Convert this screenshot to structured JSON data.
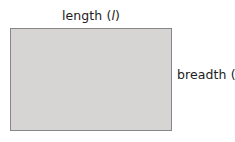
{
  "figure": {
    "type": "geometry-diagram",
    "shape": "rectangle",
    "background_color": "#ffffff",
    "rectangle": {
      "name": "rectangle",
      "fill_color": "#d6d5d3",
      "stroke_color": "#878787",
      "stroke_width_px": 1.5,
      "x_px": 10,
      "y_px": 28,
      "width_px": 162,
      "height_px": 103
    },
    "labels": {
      "length": {
        "text": "length (l)",
        "word": "length",
        "open_paren": "(",
        "variable": "l",
        "close_paren": ")",
        "position": "top-center",
        "color": "#1c1c1c"
      },
      "breadth": {
        "text": "breadth (b)",
        "word": "breadth",
        "open_paren": "(",
        "variable": "b",
        "close_paren": ")",
        "position": "right-middle",
        "color": "#1c1c1c"
      }
    }
  }
}
